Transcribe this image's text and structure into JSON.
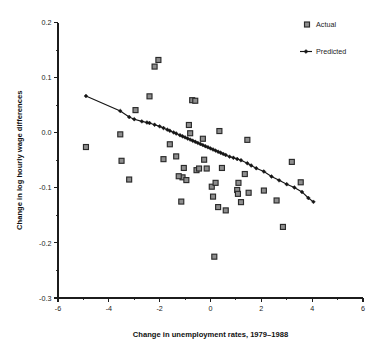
{
  "chart_data": {
    "type": "scatter",
    "title": "",
    "xlabel": "Change in unemployment rates, 1979–1988",
    "ylabel": "Change in log hourly wage differences",
    "xlim": [
      -6,
      6
    ],
    "ylim": [
      -0.3,
      0.2
    ],
    "xticks": [
      -6,
      -4,
      -2,
      0,
      2,
      4,
      6
    ],
    "xtick_labels": [
      "-6",
      "-4",
      "-2",
      "0",
      "2",
      "4",
      "6"
    ],
    "xminor_ticks": [
      -5,
      -3,
      -1,
      1,
      3,
      5
    ],
    "yticks": [
      -0.3,
      -0.2,
      -0.1,
      0.0,
      0.1,
      0.2
    ],
    "ytick_labels": [
      "-0.3",
      "-0.2",
      "-0.1",
      "0.0",
      "0.1",
      "0.2"
    ],
    "yminor_ticks": [
      -0.25,
      -0.15,
      -0.05,
      0.05,
      0.15
    ],
    "grid": false,
    "legend_position": "top-right",
    "series": [
      {
        "name": "Actual",
        "marker": "square",
        "marker_fill": "#8e8e8e",
        "marker_edge": "#2a2a2a",
        "points": [
          [
            -4.9,
            -0.026
          ],
          [
            -3.55,
            -0.003
          ],
          [
            -3.5,
            -0.051
          ],
          [
            -3.2,
            -0.085
          ],
          [
            -2.95,
            0.041
          ],
          [
            -2.4,
            0.066
          ],
          [
            -2.2,
            0.12
          ],
          [
            -2.05,
            0.132
          ],
          [
            -1.85,
            -0.048
          ],
          [
            -1.6,
            -0.021
          ],
          [
            -1.35,
            -0.043
          ],
          [
            -1.15,
            -0.125
          ],
          [
            -1.1,
            -0.081
          ],
          [
            -1.05,
            -0.064
          ],
          [
            -0.95,
            -0.086
          ],
          [
            -0.85,
            0.014
          ],
          [
            -0.8,
            -0.001
          ],
          [
            -0.72,
            0.059
          ],
          [
            -0.6,
            0.058
          ],
          [
            -0.55,
            -0.068
          ],
          [
            -0.3,
            -0.011
          ],
          [
            -0.25,
            -0.049
          ],
          [
            -0.15,
            -0.065
          ],
          [
            0.05,
            -0.098
          ],
          [
            0.1,
            -0.116
          ],
          [
            0.15,
            -0.225
          ],
          [
            0.2,
            -0.091
          ],
          [
            0.3,
            -0.135
          ],
          [
            0.35,
            0.003
          ],
          [
            0.6,
            -0.141
          ],
          [
            1.05,
            -0.104
          ],
          [
            1.08,
            -0.111
          ],
          [
            1.1,
            -0.091
          ],
          [
            1.2,
            -0.126
          ],
          [
            1.35,
            -0.075
          ],
          [
            1.45,
            -0.013
          ],
          [
            1.5,
            -0.109
          ],
          [
            2.1,
            -0.105
          ],
          [
            2.6,
            -0.123
          ],
          [
            2.85,
            -0.171
          ],
          [
            3.2,
            -0.053
          ],
          [
            3.55,
            -0.09
          ],
          [
            -0.45,
            -0.065
          ],
          [
            0.45,
            -0.064
          ],
          [
            -1.25,
            -0.079
          ]
        ]
      },
      {
        "name": "Predicted",
        "marker": "diamond",
        "line": true,
        "color": "#151515",
        "points": [
          [
            -4.9,
            0.0665
          ],
          [
            -3.55,
            0.0395
          ],
          [
            -3.2,
            0.0285
          ],
          [
            -3.0,
            0.0245
          ],
          [
            -2.7,
            0.0205
          ],
          [
            -2.5,
            0.0185
          ],
          [
            -2.4,
            0.0175
          ],
          [
            -2.2,
            0.0145
          ],
          [
            -2.0,
            0.0115
          ],
          [
            -1.85,
            0.0085
          ],
          [
            -1.7,
            0.0055
          ],
          [
            -1.6,
            0.0035
          ],
          [
            -1.45,
            0.0005
          ],
          [
            -1.35,
            -0.0015
          ],
          [
            -1.2,
            -0.0045
          ],
          [
            -1.1,
            -0.0065
          ],
          [
            -1.0,
            -0.0085
          ],
          [
            -0.9,
            -0.0105
          ],
          [
            -0.8,
            -0.0125
          ],
          [
            -0.7,
            -0.0145
          ],
          [
            -0.6,
            -0.0165
          ],
          [
            -0.5,
            -0.0185
          ],
          [
            -0.4,
            -0.0205
          ],
          [
            -0.3,
            -0.0225
          ],
          [
            -0.2,
            -0.0245
          ],
          [
            -0.1,
            -0.0265
          ],
          [
            0.0,
            -0.0285
          ],
          [
            0.1,
            -0.0305
          ],
          [
            0.2,
            -0.0325
          ],
          [
            0.3,
            -0.0345
          ],
          [
            0.4,
            -0.0365
          ],
          [
            0.5,
            -0.0385
          ],
          [
            0.6,
            -0.0405
          ],
          [
            0.75,
            -0.0435
          ],
          [
            0.9,
            -0.0455
          ],
          [
            1.05,
            -0.0478
          ],
          [
            1.2,
            -0.05
          ],
          [
            1.45,
            -0.0555
          ],
          [
            1.6,
            -0.0595
          ],
          [
            1.8,
            -0.0645
          ],
          [
            2.1,
            -0.0705
          ],
          [
            2.4,
            -0.0795
          ],
          [
            2.7,
            -0.0865
          ],
          [
            3.0,
            -0.0935
          ],
          [
            3.3,
            -0.0995
          ],
          [
            3.6,
            -0.1075
          ],
          [
            3.85,
            -0.1185
          ],
          [
            4.05,
            -0.1255
          ]
        ]
      }
    ],
    "legend": [
      {
        "label": "Actual",
        "marker": "square"
      },
      {
        "label": "Predicted",
        "marker": "line-diamond"
      }
    ]
  },
  "axes": {
    "x_title": "Change in unemployment rates, 1979–1988",
    "y_title": "Change in log hourly wage differences"
  },
  "legend": {
    "actual_label": "Actual",
    "predicted_label": "Predicted"
  }
}
